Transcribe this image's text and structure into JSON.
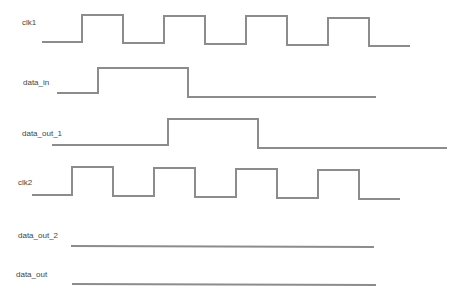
{
  "diagram": {
    "type": "timing-diagram",
    "signals": [
      {
        "name": "clk1",
        "label": "clk1"
      },
      {
        "name": "data_in",
        "label": "data_in"
      },
      {
        "name": "data_out_1",
        "label": "data_out_1"
      },
      {
        "name": "clk2",
        "label": "clk2"
      },
      {
        "name": "data_out_2",
        "label": "data_out_2"
      },
      {
        "name": "data_out",
        "label": "data_out"
      }
    ],
    "stroke_color": "#8c8c8c"
  }
}
